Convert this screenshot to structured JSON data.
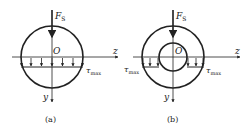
{
  "panels": [
    {
      "id": "a",
      "caption": "(a)",
      "section": "solid circular",
      "force_label": "F",
      "force_sub": "S",
      "origin_label": "O",
      "z_label": "z",
      "y_label": "y",
      "tau_label": "τ",
      "tau_sub": "max"
    },
    {
      "id": "b",
      "caption": "(b)",
      "section": "hollow circular (annulus)",
      "force_label": "F",
      "force_sub": "S",
      "origin_label": "O",
      "z_label": "z",
      "y_label": "y",
      "tau_label": "τ",
      "tau_sub": "max"
    }
  ],
  "colors": {
    "line": "#222222",
    "background": "#ffffff"
  }
}
